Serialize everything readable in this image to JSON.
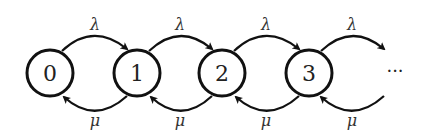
{
  "diagram": {
    "type": "birth-death-markov-chain",
    "states": [
      {
        "label": "0",
        "cx": 50,
        "cy": 73
      },
      {
        "label": "1",
        "cx": 137,
        "cy": 73
      },
      {
        "label": "2",
        "cx": 222,
        "cy": 73
      },
      {
        "label": "3",
        "cx": 309,
        "cy": 73
      }
    ],
    "continuation": "···",
    "forward_rate": "λ",
    "backward_rate": "μ",
    "transitions": [
      {
        "from": "0",
        "to": "1",
        "label": "λ"
      },
      {
        "from": "1",
        "to": "2",
        "label": "λ"
      },
      {
        "from": "2",
        "to": "3",
        "label": "λ"
      },
      {
        "from": "3",
        "to": "···",
        "label": "λ"
      },
      {
        "from": "1",
        "to": "0",
        "label": "μ"
      },
      {
        "from": "2",
        "to": "1",
        "label": "μ"
      },
      {
        "from": "3",
        "to": "2",
        "label": "μ"
      },
      {
        "from": "···",
        "to": "3",
        "label": "μ"
      }
    ]
  }
}
